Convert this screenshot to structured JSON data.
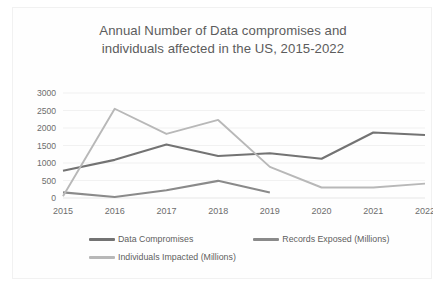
{
  "chart_data": {
    "type": "line",
    "title": "Annual Number of Data compromises and\nindividuals affected  in the US, 2015-2022",
    "xlabel": "",
    "ylabel": "",
    "categories": [
      "2015",
      "2016",
      "2017",
      "2018",
      "2019",
      "2020",
      "2021",
      "2022"
    ],
    "x": [
      2015,
      2016,
      2017,
      2018,
      2019,
      2020,
      2021,
      2022
    ],
    "ylim": [
      0,
      3000
    ],
    "yticks": [
      0,
      500,
      1000,
      1500,
      2000,
      2500,
      3000
    ],
    "ytick_labels": [
      "0",
      "500",
      "1000",
      "1500",
      "2000",
      "2500",
      "3000"
    ],
    "grid": true,
    "grid_axis": "y",
    "legend_position": "bottom",
    "series": [
      {
        "name": "Data Compromises",
        "color": "#737373",
        "values": [
          780,
          1090,
          1530,
          1200,
          1280,
          1120,
          1870,
          1800
        ]
      },
      {
        "name": "Records Exposed (Millions)",
        "color": "#8a8a8a",
        "values": [
          160,
          30,
          220,
          490,
          160,
          null,
          null,
          null
        ]
      },
      {
        "name": "Individuals Impacted (Millions)",
        "color": "#b8b8b8",
        "values": [
          50,
          2550,
          1830,
          2230,
          890,
          300,
          300,
          410
        ]
      }
    ]
  },
  "colors": {
    "background": "#ffffff",
    "card_background": "#fefefe",
    "card_border": "#f1f1f1",
    "title_text": "#5c5c5c",
    "tick_text": "#6d6d6d",
    "gridline": "#eeeeee",
    "series_1": "#737373",
    "series_2": "#8a8a8a",
    "series_3": "#b8b8b8"
  }
}
